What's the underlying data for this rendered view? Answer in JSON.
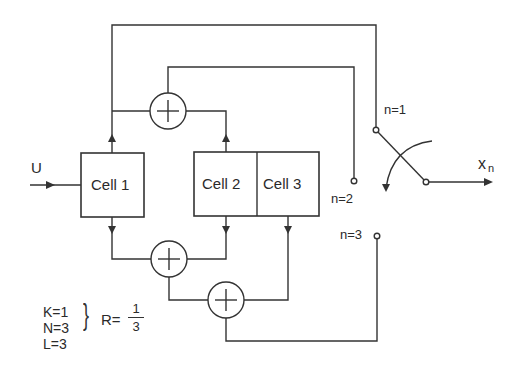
{
  "diagram": {
    "input_label": "U",
    "output_label": "x",
    "output_subscript": "n",
    "cells": [
      {
        "label": "Cell 1"
      },
      {
        "label": "Cell 2"
      },
      {
        "label": "Cell 3"
      }
    ],
    "switch_positions": [
      {
        "label": "n=1"
      },
      {
        "label": "n=2"
      },
      {
        "label": "n=3"
      }
    ],
    "adders": [
      {
        "name": "adder-top",
        "symbol": "+"
      },
      {
        "name": "adder-bottom-1",
        "symbol": "+"
      },
      {
        "name": "adder-bottom-2",
        "symbol": "+"
      }
    ],
    "parameters": {
      "k": "K=1",
      "n": "N=3",
      "l": "L=3",
      "brace": "}",
      "rate_prefix": "R=",
      "rate_numerator": "1",
      "rate_denominator": "3"
    }
  }
}
